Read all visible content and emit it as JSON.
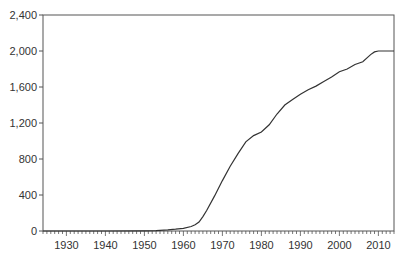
{
  "chart_data": {
    "type": "line",
    "title": "",
    "xlabel": "",
    "ylabel": "",
    "xlim": [
      1924,
      2014
    ],
    "ylim": [
      0,
      2400
    ],
    "grid": false,
    "legend": null,
    "y_ticks": [
      0,
      400,
      800,
      1200,
      1600,
      2000,
      2400
    ],
    "y_tick_labels": [
      "0",
      "400",
      "800",
      "1,200",
      "1,600",
      "2,000",
      "2,400"
    ],
    "x_ticks": [
      1930,
      1940,
      1950,
      1960,
      1970,
      1980,
      1990,
      2000,
      2010
    ],
    "x_tick_labels": [
      "1930",
      "1940",
      "1950",
      "1960",
      "1970",
      "1980",
      "1990",
      "2000",
      "2010"
    ],
    "series": [
      {
        "name": "series",
        "color": "#333333",
        "x": [
          1924,
          1930,
          1940,
          1950,
          1953,
          1956,
          1958,
          1960,
          1962,
          1963,
          1964,
          1965,
          1966,
          1968,
          1970,
          1972,
          1974,
          1976,
          1978,
          1980,
          1982,
          1984,
          1986,
          1988,
          1990,
          1992,
          1994,
          1996,
          1998,
          2000,
          2002,
          2004,
          2006,
          2008,
          2009,
          2010,
          2012,
          2014
        ],
        "values": [
          0,
          0,
          0,
          2,
          5,
          12,
          20,
          30,
          50,
          70,
          100,
          160,
          230,
          390,
          560,
          720,
          860,
          990,
          1060,
          1100,
          1180,
          1300,
          1400,
          1460,
          1520,
          1570,
          1610,
          1660,
          1710,
          1770,
          1800,
          1850,
          1880,
          1960,
          1990,
          2000,
          2000,
          2000
        ]
      }
    ]
  }
}
